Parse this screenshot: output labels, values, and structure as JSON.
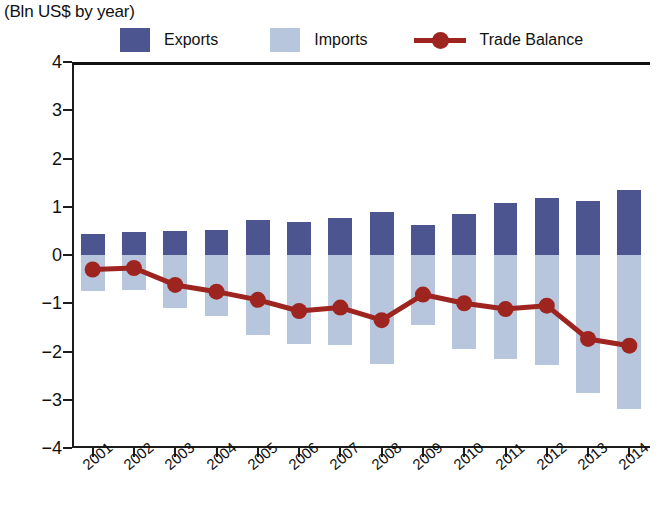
{
  "header": {
    "title_clipped": "Exports, Imports and Trade Balance",
    "subtitle": "(Bln US$ by year)"
  },
  "legend": {
    "exports_label": "Exports",
    "imports_label": "Imports",
    "balance_label": "Trade Balance"
  },
  "colors": {
    "exports": "#4C5590",
    "imports": "#B7C6DC",
    "balance": "#9E2420",
    "axis": "#1C1C1C",
    "background": "#FFFFFF"
  },
  "chart_data": {
    "type": "bar",
    "title": "Exports, Imports and Trade Balance",
    "subtitle": "(Bln US$ by year)",
    "xlabel": "",
    "ylabel": "Bln US$ by year",
    "ylim": [
      -4,
      4
    ],
    "ytick_step": 1,
    "ytick_labels": [
      "4",
      "3",
      "2",
      "1",
      "0",
      "−1",
      "−2",
      "−3",
      "−4"
    ],
    "ytick_values": [
      4,
      3,
      2,
      1,
      0,
      -1,
      -2,
      -3,
      -4
    ],
    "grid": false,
    "legend_position": "top",
    "zero_line": true,
    "categories": [
      "2001",
      "2002",
      "2003",
      "2004",
      "2005",
      "2006",
      "2007",
      "2008",
      "2009",
      "2010",
      "2011",
      "2012",
      "2013",
      "2014"
    ],
    "series": [
      {
        "name": "Exports",
        "type": "bar",
        "color": "#4C5590",
        "values": [
          0.44,
          0.47,
          0.49,
          0.52,
          0.72,
          0.68,
          0.76,
          0.9,
          0.63,
          0.86,
          1.08,
          1.19,
          1.11,
          1.35
        ]
      },
      {
        "name": "Imports",
        "type": "bar",
        "color": "#B7C6DC",
        "values": [
          -0.75,
          -0.73,
          -1.1,
          -1.27,
          -1.65,
          -1.85,
          -1.87,
          -2.25,
          -1.45,
          -1.95,
          -2.15,
          -2.28,
          -2.85,
          -3.2
        ]
      },
      {
        "name": "Trade Balance",
        "type": "line",
        "color": "#9E2420",
        "values": [
          -0.3,
          -0.27,
          -0.62,
          -0.76,
          -0.93,
          -1.16,
          -1.09,
          -1.35,
          -0.82,
          -1.0,
          -1.12,
          -1.05,
          -1.74,
          -1.88
        ]
      }
    ]
  }
}
